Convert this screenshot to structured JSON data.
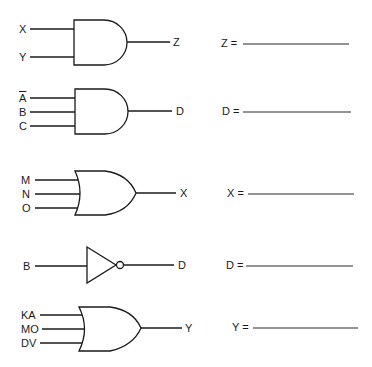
{
  "gates": [
    {
      "id": "gate1",
      "type": "AND",
      "inputs": [
        "X",
        "Y"
      ],
      "output": "Z",
      "answer_label": "Z ="
    },
    {
      "id": "gate2",
      "type": "AND",
      "inputs": [
        "A",
        "B",
        "C"
      ],
      "inputs_inverted": [
        true,
        false,
        false
      ],
      "output": "D",
      "answer_label": "D ="
    },
    {
      "id": "gate3",
      "type": "OR",
      "inputs": [
        "M",
        "N",
        "O"
      ],
      "output": "X",
      "answer_label": "X ="
    },
    {
      "id": "gate4",
      "type": "NOT",
      "inputs": [
        "B"
      ],
      "output": "D",
      "answer_label": "D ="
    },
    {
      "id": "gate5",
      "type": "OR",
      "inputs": [
        "KA",
        "MO",
        "DV"
      ],
      "output": "Y",
      "answer_label": "Y ="
    }
  ]
}
